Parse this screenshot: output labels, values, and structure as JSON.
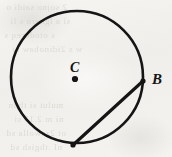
{
  "figure": {
    "kind": "geometry-diagram",
    "background_color": "#f3f2ef",
    "ink_color": "#151515"
  },
  "labels": {
    "center": "C",
    "point_b": "B"
  },
  "geometry": {
    "circle": {
      "center_x": 77,
      "center_y": 77,
      "radius": 66,
      "stroke_width": 2.6
    },
    "center_dot": {
      "x": 75,
      "y": 79,
      "radius": 3.1
    },
    "chord": {
      "from_x": 143,
      "from_y": 81,
      "to_x": 73,
      "to_y": 145,
      "stroke_width": 3.1
    },
    "point_b_marker": {
      "x": 143,
      "y": 81,
      "radius": 2.6
    },
    "point_bottom_marker": {
      "x": 73,
      "y": 145,
      "radius": 2.6
    }
  },
  "ghost_text": {
    "line_1": "2 sojno saidi o",
    "line_2": "si a lgnaro s li",
    "line_3": "s otodoreq s",
    "line_4": "w s 2idinobaw si",
    "line_5": "mulut si tbnn",
    "line_6": "ni m 2.11 si",
    "line_7": "ot 2zswolla sd",
    "line_8": "nI .thgish sd"
  }
}
